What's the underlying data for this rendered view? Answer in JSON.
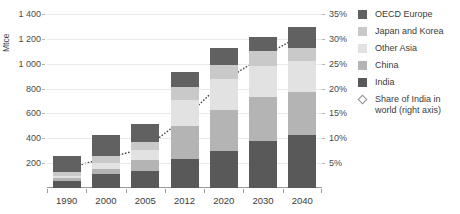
{
  "chart_data": {
    "type": "bar",
    "title": "World industrial sector coal demand",
    "categories": [
      "1990",
      "2000",
      "2005",
      "2012",
      "2020",
      "2030",
      "2040"
    ],
    "ylabel": "Mtce",
    "xlabel": "",
    "ylim": [
      0,
      1400
    ],
    "y_ticks": [
      200,
      400,
      600,
      800,
      1000,
      1200,
      1400
    ],
    "y_tick_labels": [
      "200",
      "400",
      "600",
      "800",
      "1 000",
      "1 200",
      "1 400"
    ],
    "y2label": "",
    "y2lim": [
      0,
      35
    ],
    "y2_ticks": [
      5,
      10,
      15,
      20,
      25,
      30,
      35
    ],
    "y2_tick_labels": [
      "5%",
      "10%",
      "15%",
      "20%",
      "25%",
      "30%",
      "35%"
    ],
    "grid": true,
    "legend_position": "right",
    "stacked": true,
    "series": [
      {
        "name": "India",
        "color": "#595959",
        "order": 0,
        "values": [
          55,
          110,
          140,
          230,
          300,
          380,
          430
        ]
      },
      {
        "name": "China",
        "color": "#b4b4b4",
        "order": 1,
        "values": [
          25,
          45,
          85,
          265,
          330,
          350,
          340
        ]
      },
      {
        "name": "Other Asia",
        "color": "#e2e2e2",
        "order": 2,
        "values": [
          20,
          45,
          80,
          210,
          250,
          255,
          250
        ]
      },
      {
        "name": "Japan and Korea",
        "color": "#c9c9c9",
        "order": 3,
        "values": [
          30,
          55,
          65,
          105,
          110,
          115,
          110
        ]
      },
      {
        "name": "OECD Europe",
        "color": "#616161",
        "order": 4,
        "values": [
          130,
          175,
          145,
          125,
          135,
          115,
          165
        ]
      }
    ],
    "line_series": {
      "name": "Share of India in world (right axis)",
      "axis": "right",
      "color": "#4a4a4a",
      "marker": "diamond",
      "linestyle": "dotted",
      "values": [
        4.0,
        6.0,
        8.0,
        14.0,
        21.5,
        26.5,
        30.8
      ],
      "value_labels": [
        "4%",
        "6%",
        "8%",
        "14%",
        "21.5%",
        "26.5%",
        "31%"
      ]
    },
    "legend": [
      {
        "label": "OECD Europe",
        "color": "#616161",
        "marker": "square"
      },
      {
        "label": "Japan and Korea",
        "color": "#c9c9c9",
        "marker": "square"
      },
      {
        "label": "Other Asia",
        "color": "#e2e2e2",
        "marker": "square"
      },
      {
        "label": "China",
        "color": "#b4b4b4",
        "marker": "square"
      },
      {
        "label": "India",
        "color": "#595959",
        "marker": "square"
      },
      {
        "label": "Share of India in world (right axis)",
        "color": "#8d8d8d",
        "marker": "diamond"
      }
    ]
  }
}
